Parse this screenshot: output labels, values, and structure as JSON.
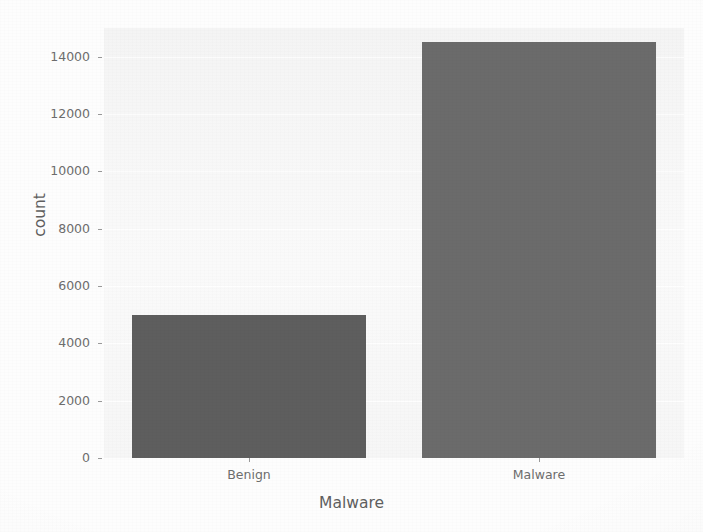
{
  "chart_data": {
    "type": "bar",
    "title": "",
    "subtitle": "",
    "categories": [
      "Benign",
      "Malware"
    ],
    "values": [
      5000,
      14500
    ],
    "series": [
      {
        "name": "count",
        "values": [
          5000,
          14500
        ]
      }
    ],
    "xlabel": "Malware",
    "ylabel": "count",
    "ylim": [
      0,
      15000
    ],
    "yticks": [
      0,
      2000,
      4000,
      6000,
      8000,
      10000,
      12000,
      14000
    ],
    "ytick_labels": [
      "0",
      "2000",
      "4000",
      "6000",
      "8000",
      "10000",
      "12000",
      "14000"
    ],
    "xtick_labels": [
      "Benign",
      "Malware"
    ],
    "grid": true,
    "grid_axis": "y",
    "legend": false,
    "legend_position": "none",
    "bar_colors": [
      "#5e5e5e",
      "#6b6b6b"
    ],
    "plot_background": "#f5f5f5",
    "figure_background": "#fdfdfd",
    "tick_color": "#6d6d6d",
    "label_color": "#5f5f5f"
  },
  "axes": {
    "y": {
      "label": "count",
      "ticks": [
        {
          "label": "14000",
          "value": 14000
        },
        {
          "label": "12000",
          "value": 12000
        },
        {
          "label": "10000",
          "value": 10000
        },
        {
          "label": "8000",
          "value": 8000
        },
        {
          "label": "6000",
          "value": 6000
        },
        {
          "label": "4000",
          "value": 4000
        },
        {
          "label": "2000",
          "value": 2000
        },
        {
          "label": "0",
          "value": 0
        }
      ]
    },
    "x": {
      "label": "Malware",
      "ticks": [
        {
          "label": "Benign"
        },
        {
          "label": "Malware"
        }
      ]
    }
  },
  "bars": [
    {
      "category": "Benign",
      "count": 5000,
      "color": "#5e5e5e"
    },
    {
      "category": "Malware",
      "count": 14500,
      "color": "#6b6b6b"
    }
  ]
}
